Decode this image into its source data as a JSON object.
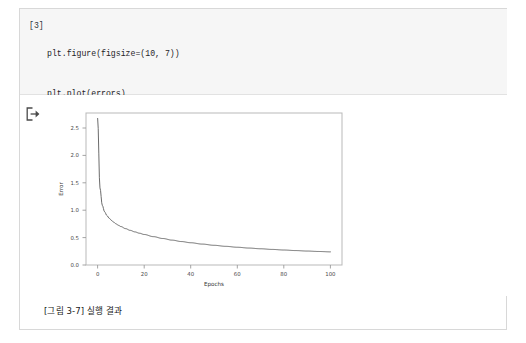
{
  "page": {
    "caption": "[그림 3-7] 실행 결과"
  },
  "code_cell": {
    "prompt": "[3]",
    "lines": [
      "plt.figure(figsize=(10, 7))",
      "plt.plot(errors)",
      "plt.xlabel('Epochs')",
      "plt.ylabel('Error')",
      "plt.show()"
    ]
  },
  "output_cell": {
    "arrow_icon": "output-arrow-icon"
  },
  "chart_data": {
    "type": "line",
    "title": "",
    "xlabel": "Epochs",
    "ylabel": "Error",
    "xlim": [
      -5,
      105
    ],
    "ylim": [
      -0.08,
      2.72
    ],
    "xticks": [
      0,
      20,
      40,
      60,
      80,
      100
    ],
    "yticks": [
      0.0,
      0.5,
      1.0,
      1.5,
      2.0,
      2.5
    ],
    "xtick_labels": [
      "0",
      "20",
      "40",
      "60",
      "80",
      "100"
    ],
    "ytick_labels": [
      "0.0",
      "0.5",
      "1.0",
      "1.5",
      "2.0",
      "2.5"
    ],
    "grid": false,
    "legend": false,
    "line_color": "#5a5a5a",
    "series": [
      {
        "name": "errors",
        "x": [
          0,
          1,
          2,
          3,
          4,
          5,
          6,
          7,
          8,
          9,
          10,
          12,
          14,
          16,
          18,
          20,
          24,
          28,
          32,
          36,
          40,
          45,
          50,
          55,
          60,
          65,
          70,
          75,
          80,
          85,
          90,
          95,
          100
        ],
        "y": [
          2.62,
          1.34,
          1.02,
          0.9,
          0.83,
          0.78,
          0.74,
          0.705,
          0.675,
          0.65,
          0.628,
          0.59,
          0.558,
          0.53,
          0.505,
          0.482,
          0.442,
          0.408,
          0.378,
          0.352,
          0.33,
          0.305,
          0.283,
          0.264,
          0.247,
          0.232,
          0.219,
          0.207,
          0.196,
          0.186,
          0.177,
          0.169,
          0.162
        ]
      }
    ]
  }
}
